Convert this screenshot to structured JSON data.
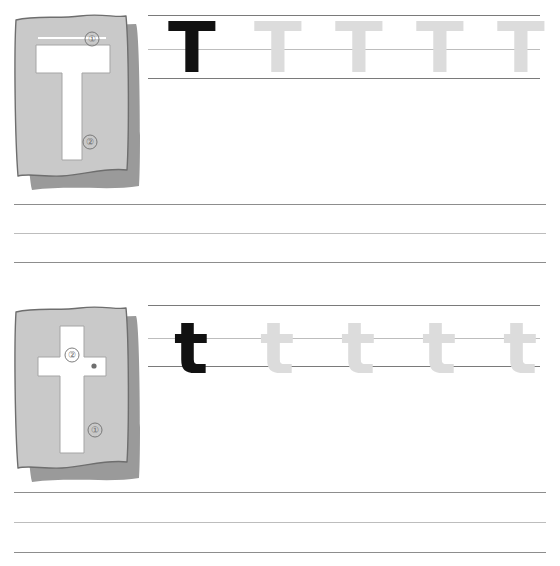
{
  "worksheet": {
    "title": "Letter T Handwriting Practice Worksheet",
    "letter": "T",
    "background_color": "#ffffff"
  },
  "colors": {
    "card_fill": "#c9c9c9",
    "card_outline": "#6e6e6e",
    "card_shadow": "#9a9a9a",
    "letter_window": "#ffffff",
    "model_letter": "#111111",
    "trace_letter": "#dcdcdc",
    "rule_line": "#8d8d8d",
    "rule_line_faint": "#bdbdbd",
    "marker_text": "#6f6f6f"
  },
  "sections": [
    {
      "id": "uppercase",
      "name": "uppercase-section",
      "card": {
        "name": "uppercase-letter-card",
        "letter": "T",
        "case": "uppercase",
        "stroke_markers": [
          {
            "label": "①",
            "number": 1,
            "stroke": "horizontal-top-bar",
            "x": 92,
            "y": 38
          },
          {
            "label": "②",
            "number": 2,
            "stroke": "vertical-stem",
            "x": 90,
            "y": 140
          }
        ]
      },
      "practice_row": {
        "name": "uppercase-practice-row",
        "model": {
          "letter": "T",
          "style": "model"
        },
        "traces": [
          {
            "letter": "T",
            "style": "trace"
          },
          {
            "letter": "T",
            "style": "trace"
          },
          {
            "letter": "T",
            "style": "trace"
          },
          {
            "letter": "T",
            "style": "trace"
          }
        ],
        "guide_lines": [
          "top",
          "midline",
          "baseline"
        ]
      },
      "blank_lines_count": 3
    },
    {
      "id": "lowercase",
      "name": "lowercase-section",
      "card": {
        "name": "lowercase-letter-card",
        "letter": "t",
        "case": "lowercase",
        "stroke_markers": [
          {
            "label": "②",
            "number": 2,
            "stroke": "horizontal-crossbar",
            "x": 70,
            "y": 349
          },
          {
            "label": "①",
            "number": 1,
            "stroke": "vertical-stem",
            "x": 93,
            "y": 423
          }
        ]
      },
      "practice_row": {
        "name": "lowercase-practice-row",
        "model": {
          "letter": "t",
          "style": "model"
        },
        "traces": [
          {
            "letter": "t",
            "style": "trace"
          },
          {
            "letter": "t",
            "style": "trace"
          },
          {
            "letter": "t",
            "style": "trace"
          },
          {
            "letter": "t",
            "style": "trace"
          }
        ],
        "guide_lines": [
          "top",
          "midline",
          "baseline"
        ]
      },
      "blank_lines_count": 3
    }
  ],
  "geometry": {
    "upper_guides": {
      "top": 15,
      "mid": 49,
      "base": 78,
      "left": 148,
      "right": 540
    },
    "lower_guides": {
      "top": 305,
      "mid": 338,
      "base": 366,
      "left": 148,
      "right": 540
    },
    "upper_blank_lines": [
      204,
      233,
      262
    ],
    "lower_blank_lines": [
      492,
      522,
      552
    ],
    "blank_line_left": 14,
    "blank_line_right": 546,
    "uppercase_letter_x": [
      172,
      258,
      339,
      420,
      501
    ],
    "lowercase_letter_x": [
      176,
      262,
      343,
      424,
      505
    ]
  }
}
